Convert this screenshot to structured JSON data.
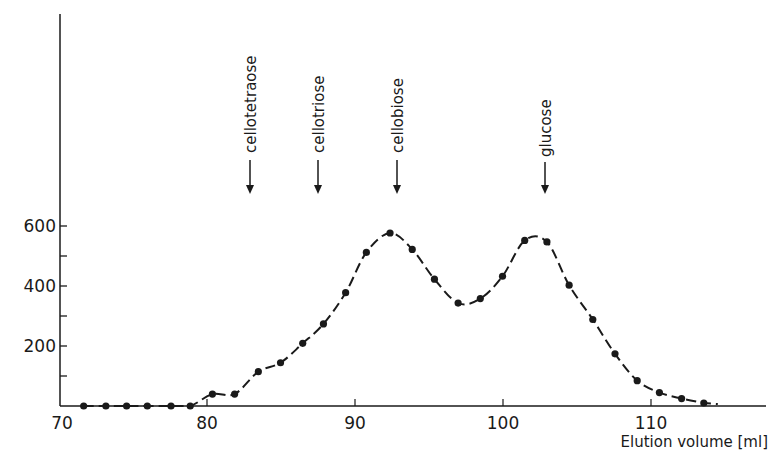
{
  "chart_data": {
    "type": "line",
    "title": "",
    "xlabel": "Elution volume [ml]",
    "ylabel": "",
    "xlim": [
      70,
      115
    ],
    "ylim": [
      0,
      650
    ],
    "xticks": [
      70,
      80,
      90,
      100,
      110
    ],
    "yticks_labeled": [
      200,
      400,
      600
    ],
    "yticks_minor": [
      100,
      300,
      500
    ],
    "grid": false,
    "legend": null,
    "series": [
      {
        "name": "elution profile",
        "marker": "filled-circle",
        "line_style": "dashed",
        "x": [
          71.6,
          73.1,
          74.5,
          75.9,
          77.5,
          78.8,
          80.3,
          81.8,
          83.4,
          84.9,
          86.4,
          87.8,
          89.3,
          90.7,
          92.3,
          93.8,
          95.3,
          96.9,
          98.4,
          99.9,
          101.4,
          102.9,
          104.4,
          106.0,
          107.5,
          109.0,
          110.5,
          112.0,
          113.5
        ],
        "values": [
          0,
          0,
          0,
          0,
          0,
          0,
          40,
          40,
          115,
          145,
          210,
          275,
          380,
          515,
          580,
          525,
          425,
          345,
          360,
          435,
          555,
          550,
          405,
          290,
          175,
          85,
          45,
          25,
          10
        ]
      }
    ],
    "annotations": [
      {
        "label": "cellotetraose",
        "x": 82.9,
        "type": "down-arrow"
      },
      {
        "label": "cellotriose",
        "x": 87.5,
        "type": "down-arrow"
      },
      {
        "label": "cellobiose",
        "x": 92.8,
        "type": "down-arrow"
      },
      {
        "label": "glucose",
        "x": 102.8,
        "type": "down-arrow"
      }
    ]
  },
  "axis": {
    "x_ticks": [
      "70",
      "80",
      "90",
      "100",
      "110"
    ],
    "y_ticks": [
      "200",
      "400",
      "600"
    ],
    "xlabel": "Elution volume [ml]"
  },
  "annotations": {
    "a0": "cellotetraose",
    "a1": "cellotriose",
    "a2": "cellobiose",
    "a3": "glucose"
  }
}
